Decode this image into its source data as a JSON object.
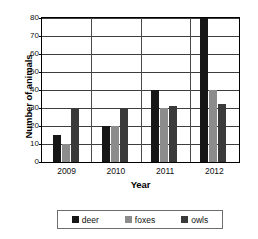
{
  "chart_data": {
    "type": "bar",
    "title": "",
    "xlabel": "Year",
    "ylabel": "Number of animals",
    "categories": [
      "2009",
      "2010",
      "2011",
      "2012"
    ],
    "series": [
      {
        "name": "deer",
        "color": "#161616",
        "values": [
          15,
          20,
          40,
          80
        ]
      },
      {
        "name": "foxes",
        "color": "#8c8c8c",
        "values": [
          10,
          20,
          30,
          40
        ]
      },
      {
        "name": "owls",
        "color": "#3a3a3a",
        "values": [
          30,
          30,
          31,
          32
        ]
      }
    ],
    "ylim": [
      0,
      80
    ],
    "yticks": [
      0,
      10,
      20,
      30,
      40,
      50,
      60,
      70,
      80
    ],
    "ytick_labels": [
      "0",
      "10",
      "20",
      "30",
      "40",
      "50",
      "60",
      "70",
      "80"
    ],
    "grid": true,
    "legend_position": "bottom"
  },
  "legend": {
    "items": [
      {
        "label": "deer"
      },
      {
        "label": "foxes"
      },
      {
        "label": "owls"
      }
    ]
  }
}
